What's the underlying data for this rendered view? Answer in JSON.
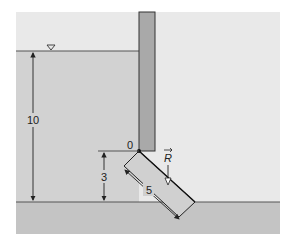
{
  "diagram": {
    "colors": {
      "background": "#ffffff",
      "air": "#e9e9e9",
      "water": "#cfcfcf",
      "ground": "#c2c2c2",
      "wall": "#a9a9a9",
      "gate": "#cfcfcf",
      "line": "#333333"
    },
    "labels": {
      "water_depth": "10",
      "hinge_height": "3",
      "gate_length": "5",
      "hinge_point": "0",
      "force": "R",
      "force_vector_arrow": "→"
    },
    "icons": {
      "free_surface": "inverted-triangle-icon"
    }
  }
}
